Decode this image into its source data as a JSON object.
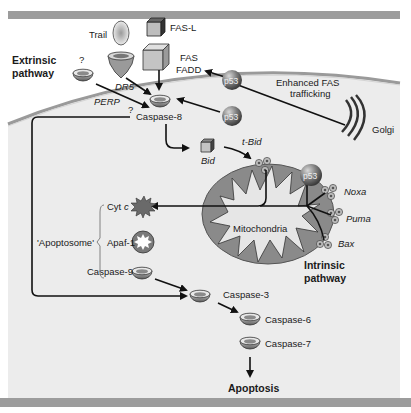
{
  "figure": {
    "type": "pathway-diagram",
    "colors": {
      "background_band": "#9c9c9c",
      "cytoplasm": "#ececec",
      "membrane": "#a8a8a8",
      "mitochondria_outer": "#8a8a8a",
      "mitochondria_inner": "#e6e6e6",
      "p53_sphere": "#7a7a7a",
      "arrow": "#111111"
    }
  },
  "labels": {
    "extrinsic_pathway_1": "Extrinsic",
    "extrinsic_pathway_2": "pathway",
    "intrinsic_pathway_1": "Intrinsic",
    "intrinsic_pathway_2": "pathway",
    "unknown_receptor": "?",
    "perp_question": "?",
    "trail": "Trail",
    "fas_l": "FAS-L",
    "fas": "FAS",
    "fadd": "FADD",
    "dr5": "DR5",
    "perp": "PERP",
    "caspase_8": "Caspase-8",
    "p53_top": "p53",
    "p53_mid": "p53",
    "p53_mito": "p53",
    "enhanced_fas_1": "Enhanced FAS",
    "enhanced_fas_2": "trafficking",
    "golgi": "Golgi",
    "bid": "Bid",
    "t_bid": "t-Bid",
    "noxa": "Noxa",
    "puma": "Puma",
    "bax": "Bax",
    "mitochondria": "Mitochondria",
    "cyt_c_1": "Cyt ",
    "cyt_c_2": "c",
    "apaf_1": "Apaf-1",
    "caspase_9": "Caspase-9",
    "apoptosome": "'Apoptosome'",
    "caspase_3": "Caspase-3",
    "caspase_6": "Caspase-6",
    "caspase_7": "Caspase-7",
    "apoptosis": "Apoptosis"
  }
}
